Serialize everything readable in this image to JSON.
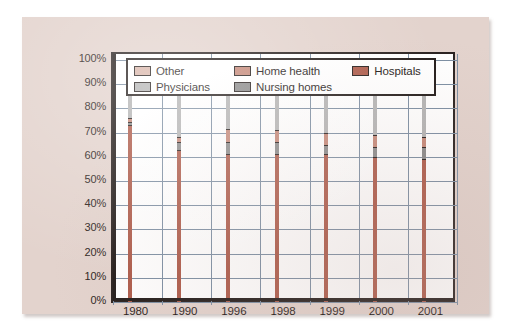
{
  "document": {
    "background_color": "#ffffff",
    "paper_color": "#e3d3cd"
  },
  "legend": {
    "position": "top-inside",
    "rows": [
      [
        {
          "label": "Other",
          "color": "#d9b5a9"
        },
        {
          "label": "Home health",
          "color": "#c58878"
        },
        {
          "label": "Hospitals",
          "color": "#ae5c4b"
        }
      ],
      [
        {
          "label": "Physicians",
          "color": "#b4b4b4"
        },
        {
          "label": "Nursing homes",
          "color": "#8a8a8a"
        },
        {
          "label": "",
          "color": ""
        }
      ]
    ]
  },
  "chart_data": {
    "type": "bar",
    "subtype": "stacked-100-percent",
    "title": "",
    "xlabel": "",
    "ylabel": "",
    "ylim": [
      0,
      100
    ],
    "ytick_labels": [
      "100%",
      "90%",
      "80%",
      "70%",
      "60%",
      "50%",
      "40%",
      "30%",
      "20%",
      "10%",
      "0%"
    ],
    "ytick_values": [
      100,
      90,
      80,
      70,
      60,
      50,
      40,
      30,
      20,
      10,
      0
    ],
    "grid": true,
    "categories": [
      "1980",
      "1990",
      "1996",
      "1998",
      "1999",
      "2000",
      "2001"
    ],
    "series": [
      {
        "name": "Hospitals",
        "color": "#ae5c4b",
        "values": [
          73,
          63,
          61,
          61,
          61,
          60,
          59
        ]
      },
      {
        "name": "Nursing homes",
        "color": "#8a8a8a",
        "values": [
          1.5,
          3,
          5,
          5,
          4,
          4,
          5
        ]
      },
      {
        "name": "Home health",
        "color": "#c58878",
        "values": [
          1.5,
          2,
          5.5,
          5,
          5,
          5,
          4
        ]
      },
      {
        "name": "Physicians",
        "color": "#b4b4b4",
        "values": [
          21,
          29,
          23.5,
          25,
          26,
          26.5,
          27
        ]
      },
      {
        "name": "Other",
        "color": "#d9b5a9",
        "values": [
          3,
          3,
          5,
          4,
          4,
          4.5,
          5
        ]
      }
    ]
  }
}
